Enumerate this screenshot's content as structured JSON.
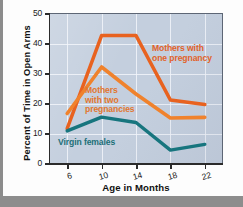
{
  "chart_data": {
    "type": "line",
    "title": "",
    "xlabel": "Age in Months",
    "ylabel": "Percent of Time in Open Arms",
    "x": [
      6,
      10,
      14,
      18,
      22
    ],
    "xlim": [
      4,
      24
    ],
    "ylim": [
      0,
      50
    ],
    "xticks": [
      "6",
      "10",
      "14",
      "18",
      "22"
    ],
    "yticks": [
      "0",
      "10",
      "20",
      "30",
      "40",
      "50"
    ],
    "grid": true,
    "legend_position": "inline-annotations",
    "series": [
      {
        "name": "Mothers with one pregnancy",
        "label": "Mothers with\none pregnancy",
        "color": "#e8621f",
        "values": [
          11.5,
          42.5,
          42.5,
          21,
          19.5
        ]
      },
      {
        "name": "Mothers with two pregnancies",
        "label": "Mothers\nwith two\npregnancies",
        "color": "#f0822c",
        "values": [
          16.5,
          32,
          23,
          15,
          15.2
        ]
      },
      {
        "name": "Virgin females",
        "label": "Virgin females",
        "color": "#17757e",
        "values": [
          10.7,
          15.3,
          13.5,
          4.3,
          6.2
        ]
      }
    ],
    "annotations": [
      {
        "text": "Mothers with one pregnancy",
        "color": "#e2622a"
      },
      {
        "text": "Mothers with two pregnancies",
        "color": "#e2762e"
      },
      {
        "text": "Virgin females",
        "color": "#1d6f78"
      }
    ]
  },
  "axis": {
    "y_title": "Percent of Time in Open Arms",
    "x_title": "Age in Months",
    "y_ticks": [
      "50",
      "40",
      "30",
      "20",
      "10",
      "0"
    ],
    "x_ticks": [
      "6",
      "10",
      "14",
      "18",
      "22"
    ]
  },
  "labels": {
    "one_pregnancy_line1": "Mothers with",
    "one_pregnancy_line2": "one pregnancy",
    "two_pregnancies_line1": "Mothers",
    "two_pregnancies_line2": "with two",
    "two_pregnancies_line3": "pregnancies",
    "virgin": "Virgin females"
  },
  "colors": {
    "one_pregnancy": "#e8621f",
    "two_pregnancies": "#f0822c",
    "virgin": "#17757e",
    "plot_background": "#c4cfde",
    "gridline": "#f2f5fa",
    "axis": "#2b2b2b",
    "page": "#fdfdfd"
  }
}
